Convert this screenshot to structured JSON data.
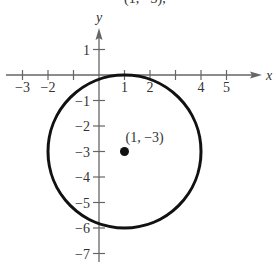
{
  "chart_data": {
    "type": "scatter",
    "title": "",
    "top_text_fragment": "(1, −3),",
    "xlabel": "x",
    "ylabel": "y",
    "xlim": [
      -3.7,
      6.2
    ],
    "ylim": [
      -7.6,
      2.3
    ],
    "grid": false,
    "x_ticks": [
      -3,
      -2,
      -1,
      1,
      2,
      3,
      4,
      5
    ],
    "x_tick_labels": [
      "−3",
      "−2",
      "1",
      "2",
      "4",
      "5"
    ],
    "y_ticks": [
      1,
      -1,
      -2,
      -3,
      -4,
      -5,
      -6,
      -7
    ],
    "y_tick_labels": [
      "1",
      "−1",
      "−2",
      "−3",
      "−4",
      "−5",
      "−6",
      "−7"
    ],
    "shapes": [
      {
        "type": "circle",
        "center": [
          1,
          -3
        ],
        "radius": 3
      }
    ],
    "points": [
      {
        "x": 1,
        "y": -3,
        "label": "(1, −3)"
      }
    ]
  }
}
